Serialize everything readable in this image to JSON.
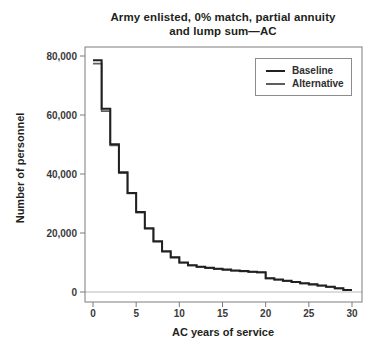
{
  "figure": {
    "title_line1": "Army enlisted, 0% match, partial annuity",
    "title_line2": "and lump sum—AC"
  },
  "chart_data": {
    "type": "line",
    "line_style": "step",
    "title": "Army enlisted, 0% match, partial annuity and lump sum—AC",
    "xlabel": "AC years of service",
    "ylabel": "Number of personnel",
    "xlim": [
      0,
      30
    ],
    "ylim": [
      0,
      80000
    ],
    "xticks": [
      0,
      5,
      10,
      15,
      20,
      25,
      30
    ],
    "xtick_labels": [
      "0",
      "5",
      "10",
      "15",
      "20",
      "25",
      "30"
    ],
    "yticks": [
      0,
      20000,
      40000,
      60000,
      80000
    ],
    "ytick_labels": [
      "0",
      "20,000",
      "40,000",
      "60,000",
      "80,000"
    ],
    "grid": false,
    "legend_position": "top-right",
    "x_step_years": [
      0,
      1,
      2,
      3,
      4,
      5,
      6,
      7,
      8,
      9,
      10,
      11,
      12,
      13,
      14,
      15,
      16,
      17,
      18,
      19,
      20,
      21,
      22,
      23,
      24,
      25,
      26,
      27,
      28,
      29
    ],
    "series": [
      {
        "name": "Baseline",
        "color": "#231f20",
        "values": [
          78600,
          62100,
          50100,
          40600,
          33600,
          27100,
          21600,
          17200,
          13800,
          11800,
          10000,
          9100,
          8600,
          8200,
          7900,
          7600,
          7300,
          7100,
          6900,
          6700,
          4700,
          4250,
          3800,
          3400,
          3000,
          2600,
          2200,
          1800,
          1300,
          700
        ]
      },
      {
        "name": "Alternative",
        "color": "#5e5e60",
        "values": [
          77400,
          61300,
          49700,
          40300,
          33400,
          26900,
          21450,
          17050,
          13650,
          11650,
          9900,
          9000,
          8500,
          8100,
          7800,
          7500,
          7200,
          7000,
          6800,
          6600,
          4600,
          4150,
          3700,
          3300,
          2900,
          2500,
          2100,
          1700,
          1200,
          600
        ]
      }
    ],
    "frame_color": "#7d7d7d",
    "zero_line_color": "#b8b8b8",
    "tick_label_color": "#3a3a3a"
  }
}
